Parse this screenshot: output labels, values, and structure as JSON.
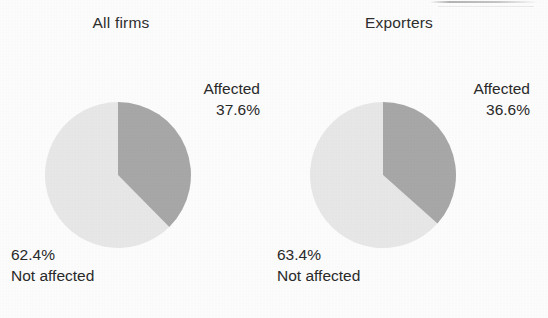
{
  "figure": {
    "background_color": "#fdfdfd",
    "text_color": "#2a2a2a",
    "affected_color": "#a8a8a8",
    "not_affected_color": "#e8e8e8"
  },
  "chart_data": [
    {
      "type": "pie",
      "title": "All firms",
      "categories": [
        "Affected",
        "Not affected"
      ],
      "values": [
        37.6,
        62.4
      ],
      "value_labels": [
        "37.6%",
        "62.4%"
      ],
      "colors": [
        "#a8a8a8",
        "#e8e8e8"
      ],
      "start_angle_deg": 0,
      "direction": "clockwise",
      "legend": "labels placed outside slices",
      "xlabel": "",
      "ylabel": ""
    },
    {
      "type": "pie",
      "title": "Exporters",
      "categories": [
        "Affected",
        "Not affected"
      ],
      "values": [
        36.6,
        63.4
      ],
      "value_labels": [
        "36.6%",
        "63.4%"
      ],
      "colors": [
        "#a8a8a8",
        "#e8e8e8"
      ],
      "start_angle_deg": 0,
      "direction": "clockwise",
      "legend": "labels placed outside slices",
      "xlabel": "",
      "ylabel": ""
    }
  ],
  "panels": [
    {
      "title": "All firms",
      "affected": {
        "name": "Affected",
        "pct": "37.6%"
      },
      "not_affected": {
        "name": "Not affected",
        "pct": "62.4%"
      }
    },
    {
      "title": "Exporters",
      "affected": {
        "name": "Affected",
        "pct": "36.6%"
      },
      "not_affected": {
        "name": "Not affected",
        "pct": "63.4%"
      }
    }
  ]
}
